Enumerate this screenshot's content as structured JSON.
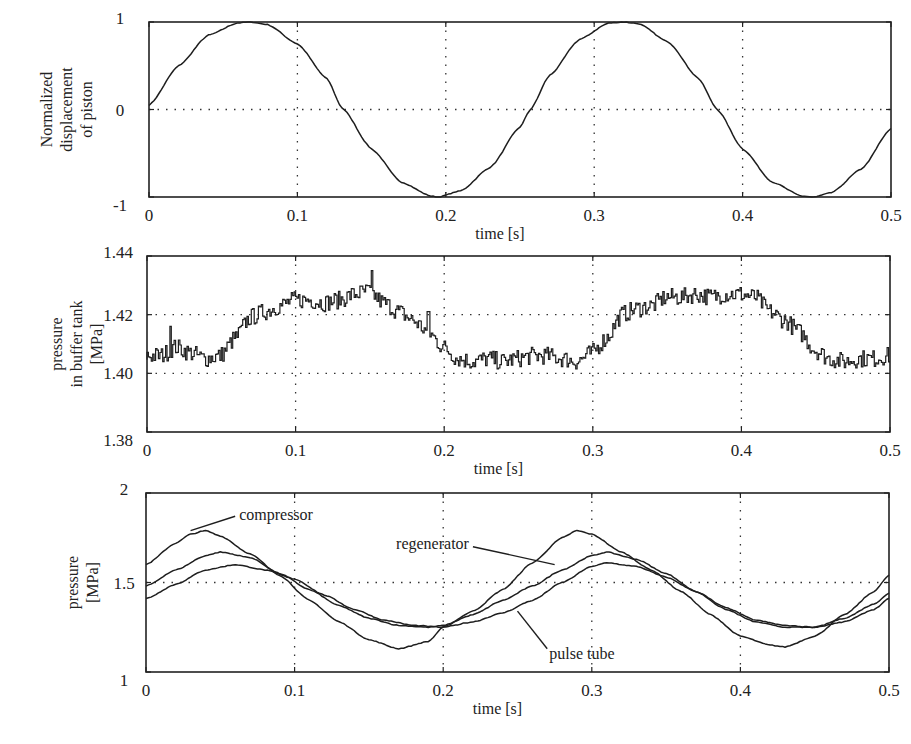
{
  "chart_data": [
    {
      "id": "displacement",
      "type": "line",
      "title": "",
      "xlabel": "time [s]",
      "ylabel": "Normalized displacement of piston",
      "ylabel_lines": [
        "Normalized",
        "displacement",
        "of piston"
      ],
      "xlim": [
        0,
        0.5
      ],
      "ylim": [
        -1,
        1
      ],
      "xticks": [
        0,
        0.1,
        0.2,
        0.3,
        0.4,
        0.5
      ],
      "xtick_labels": [
        "0",
        "0.1",
        "0.2",
        "0.3",
        "0.4",
        "0.5"
      ],
      "yticks": [
        -1,
        0,
        1
      ],
      "ytick_labels": [
        "-1",
        "0",
        "1"
      ],
      "grid": true,
      "series": [
        {
          "name": "piston displacement",
          "x": [
            0,
            0.02,
            0.04,
            0.06,
            0.068,
            0.08,
            0.1,
            0.12,
            0.13,
            0.15,
            0.17,
            0.19,
            0.195,
            0.21,
            0.23,
            0.25,
            0.257,
            0.27,
            0.29,
            0.31,
            0.32,
            0.33,
            0.35,
            0.37,
            0.383,
            0.4,
            0.42,
            0.44,
            0.448,
            0.46,
            0.48,
            0.5
          ],
          "y": [
            0.05,
            0.5,
            0.85,
            0.99,
            1.0,
            0.97,
            0.75,
            0.35,
            0.02,
            -0.45,
            -0.83,
            -0.99,
            -1.0,
            -0.93,
            -0.66,
            -0.2,
            0.0,
            0.39,
            0.8,
            0.99,
            1.0,
            0.98,
            0.77,
            0.36,
            0.0,
            -0.45,
            -0.83,
            -0.99,
            -1.0,
            -0.95,
            -0.68,
            -0.22
          ]
        }
      ]
    },
    {
      "id": "buffer_tank",
      "type": "line",
      "title": "",
      "xlabel": "time [s]",
      "ylabel": "pressure in buffer tank [MPa]",
      "ylabel_lines": [
        "pressure",
        "in buffer tank",
        "[MPa]"
      ],
      "xlim": [
        0,
        0.5
      ],
      "ylim": [
        1.38,
        1.44
      ],
      "xticks": [
        0,
        0.1,
        0.2,
        0.3,
        0.4,
        0.5
      ],
      "xtick_labels": [
        "0",
        "0.1",
        "0.2",
        "0.3",
        "0.4",
        "0.5"
      ],
      "yticks": [
        1.38,
        1.4,
        1.42,
        1.44
      ],
      "ytick_labels": [
        "1.38",
        "1.40",
        "1.42",
        "1.44"
      ],
      "grid": true,
      "series": [
        {
          "name": "buffer tank pressure (noisy)",
          "x": [
            0,
            0.01,
            0.02,
            0.03,
            0.04,
            0.05,
            0.06,
            0.07,
            0.08,
            0.09,
            0.1,
            0.11,
            0.12,
            0.13,
            0.14,
            0.15,
            0.16,
            0.17,
            0.18,
            0.19,
            0.2,
            0.21,
            0.22,
            0.23,
            0.24,
            0.25,
            0.26,
            0.27,
            0.28,
            0.29,
            0.3,
            0.31,
            0.32,
            0.33,
            0.34,
            0.35,
            0.36,
            0.37,
            0.38,
            0.39,
            0.4,
            0.41,
            0.42,
            0.43,
            0.44,
            0.45,
            0.46,
            0.47,
            0.48,
            0.49,
            0.5
          ],
          "y": [
            1.406,
            1.406,
            1.409,
            1.407,
            1.405,
            1.406,
            1.412,
            1.419,
            1.421,
            1.423,
            1.425,
            1.425,
            1.424,
            1.425,
            1.427,
            1.428,
            1.424,
            1.421,
            1.418,
            1.414,
            1.409,
            1.405,
            1.404,
            1.405,
            1.404,
            1.405,
            1.406,
            1.406,
            1.405,
            1.404,
            1.407,
            1.412,
            1.42,
            1.422,
            1.423,
            1.426,
            1.426,
            1.427,
            1.426,
            1.427,
            1.427,
            1.426,
            1.421,
            1.418,
            1.414,
            1.408,
            1.405,
            1.404,
            1.405,
            1.405,
            1.406
          ],
          "noise_amplitude": 0.003,
          "spikes": [
            {
              "x": 0.016,
              "y": 1.416
            },
            {
              "x": 0.152,
              "y": 1.435
            },
            {
              "x": 0.19,
              "y": 1.421
            }
          ]
        }
      ]
    },
    {
      "id": "pressures",
      "type": "line",
      "title": "",
      "xlabel": "time [s]",
      "ylabel": "pressure [MPa]",
      "ylabel_lines": [
        "pressure",
        "[MPa]"
      ],
      "xlim": [
        0,
        0.5
      ],
      "ylim": [
        1,
        2
      ],
      "xticks": [
        0,
        0.1,
        0.2,
        0.3,
        0.4,
        0.5
      ],
      "xtick_labels": [
        "0",
        "0.1",
        "0.2",
        "0.3",
        "0.4",
        "0.5"
      ],
      "yticks": [
        1,
        1.5,
        2
      ],
      "ytick_labels": [
        "1",
        "1.5",
        "2"
      ],
      "grid": true,
      "series": [
        {
          "name": "compressor",
          "x": [
            0,
            0.02,
            0.03,
            0.04,
            0.05,
            0.07,
            0.09,
            0.11,
            0.13,
            0.15,
            0.17,
            0.19,
            0.2,
            0.22,
            0.24,
            0.26,
            0.28,
            0.29,
            0.3,
            0.32,
            0.34,
            0.36,
            0.38,
            0.4,
            0.42,
            0.43,
            0.45,
            0.47,
            0.49,
            0.5
          ],
          "y": [
            1.6,
            1.72,
            1.77,
            1.79,
            1.76,
            1.66,
            1.54,
            1.4,
            1.28,
            1.18,
            1.13,
            1.17,
            1.25,
            1.34,
            1.46,
            1.61,
            1.75,
            1.79,
            1.77,
            1.67,
            1.57,
            1.45,
            1.32,
            1.2,
            1.15,
            1.14,
            1.2,
            1.32,
            1.45,
            1.54
          ]
        },
        {
          "name": "regenerator",
          "x": [
            0,
            0.02,
            0.04,
            0.05,
            0.07,
            0.09,
            0.11,
            0.13,
            0.15,
            0.17,
            0.19,
            0.2,
            0.22,
            0.24,
            0.26,
            0.28,
            0.3,
            0.31,
            0.33,
            0.35,
            0.37,
            0.39,
            0.41,
            0.43,
            0.45,
            0.47,
            0.49,
            0.5
          ],
          "y": [
            1.48,
            1.57,
            1.65,
            1.67,
            1.64,
            1.55,
            1.46,
            1.37,
            1.3,
            1.26,
            1.25,
            1.26,
            1.32,
            1.4,
            1.48,
            1.57,
            1.65,
            1.67,
            1.63,
            1.55,
            1.45,
            1.35,
            1.28,
            1.25,
            1.25,
            1.3,
            1.38,
            1.44
          ]
        },
        {
          "name": "pulse tube",
          "x": [
            0,
            0.02,
            0.04,
            0.06,
            0.08,
            0.1,
            0.12,
            0.14,
            0.16,
            0.18,
            0.2,
            0.22,
            0.24,
            0.26,
            0.28,
            0.3,
            0.31,
            0.33,
            0.35,
            0.37,
            0.39,
            0.41,
            0.43,
            0.45,
            0.47,
            0.49,
            0.5
          ],
          "y": [
            1.41,
            1.49,
            1.57,
            1.6,
            1.57,
            1.52,
            1.43,
            1.35,
            1.29,
            1.26,
            1.25,
            1.28,
            1.33,
            1.4,
            1.5,
            1.59,
            1.61,
            1.59,
            1.53,
            1.45,
            1.36,
            1.29,
            1.26,
            1.25,
            1.28,
            1.35,
            1.41
          ]
        }
      ],
      "annotations": [
        {
          "text": "compressor",
          "target_x": 0.03,
          "target_y": 1.79,
          "label_x": 0.06,
          "label_y": 1.87
        },
        {
          "text": "regenerator",
          "target_x": 0.275,
          "target_y": 1.6,
          "label_x": 0.22,
          "label_y": 1.7
        },
        {
          "text": "pulse tube",
          "target_x": 0.25,
          "target_y": 1.34,
          "label_x": 0.27,
          "label_y": 1.13
        }
      ]
    }
  ],
  "panels": {
    "top": {
      "xlabel": "time [s]",
      "ylabel_lines": [
        "Normalized",
        "displacement",
        "of piston"
      ]
    },
    "middle": {
      "xlabel": "time [s]",
      "ylabel_lines": [
        "pressure",
        "in buffer tank",
        "[MPa]"
      ]
    },
    "bottom": {
      "xlabel": "time [s]",
      "ylabel_lines": [
        "pressure",
        "[MPa]"
      ]
    }
  }
}
